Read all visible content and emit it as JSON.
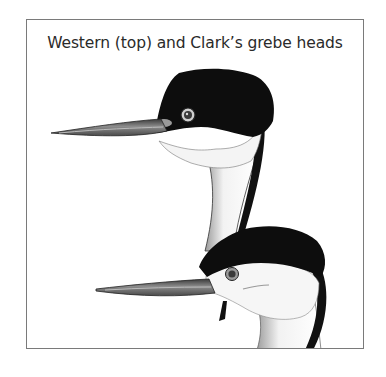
{
  "figure": {
    "caption": "Western (top) and Clark’s grebe heads",
    "illustrations": [
      {
        "name": "Western grebe head",
        "position": "top"
      },
      {
        "name": "Clark's grebe head",
        "position": "bottom"
      }
    ]
  }
}
